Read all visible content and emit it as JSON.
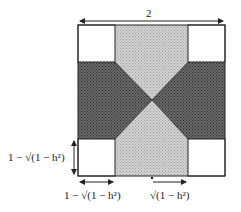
{
  "diagram": {
    "title_label": "2",
    "left_label": "1 − √(1 − h²)",
    "bottom_left_label": "1 − √(1 − h²)",
    "bottom_right_label": "√(1 − h²)",
    "colors": {
      "light_fill": "#c8c8c8",
      "dark_fill": "#5a5a5a",
      "stroke": "#222222",
      "background": "#ffffff"
    }
  }
}
